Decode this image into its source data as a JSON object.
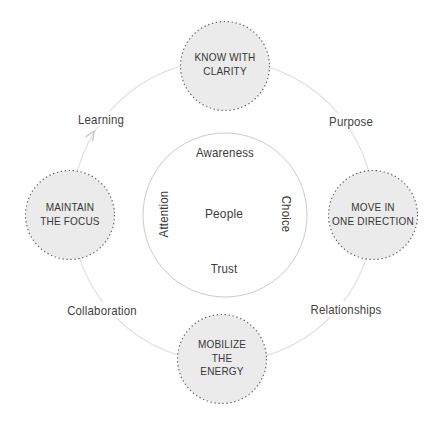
{
  "diagram": {
    "type": "cycle",
    "core_theme": {
      "core": "People",
      "top": "Awareness",
      "right": "Choice",
      "bottom": "Trust",
      "left": "Attention"
    },
    "nodes": {
      "top": {
        "lines": [
          "KNOW WITH",
          "CLARITY"
        ]
      },
      "right": {
        "lines": [
          "MOVE IN",
          "ONE DIRECTION"
        ]
      },
      "bottom": {
        "lines": [
          "MOBILIZE",
          "THE",
          "ENERGY"
        ]
      },
      "left": {
        "lines": [
          "MAINTAIN",
          "THE FOCUS"
        ]
      }
    },
    "ring_labels": {
      "top_left": "Learning",
      "top_right": "Purpose",
      "bottom_right": "Relationships",
      "bottom_left": "Collaboration"
    },
    "flow_direction": "clockwise",
    "colors": {
      "background": "#ffffff",
      "node_fill": "#ebebeb",
      "node_dotted_border": "#686868",
      "outer_ring": "#e2e2e2",
      "center_circle_border": "#cbcbcb",
      "arrow": "#c6c6c6",
      "text": "#3a3a3a"
    }
  }
}
